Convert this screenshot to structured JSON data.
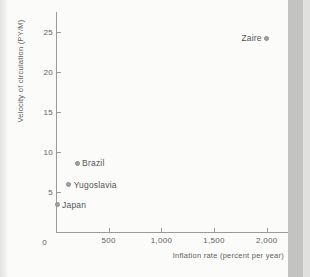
{
  "page": {
    "background": "#fbfbfa",
    "edge_strip_left_color": "#e2e2e1",
    "edge_strip_right_color": "#c3c3c2",
    "edge_strip_right_outer_color": "#e0e0df"
  },
  "chart_data": {
    "type": "scatter",
    "title": "",
    "xlabel": "Inflation rate (percent per year)",
    "ylabel": "Velocity of circulation (PY/M)",
    "xlim": [
      0,
      2200
    ],
    "ylim": [
      0,
      27.5
    ],
    "x_ticks": [
      0,
      500,
      1000,
      1500,
      2000
    ],
    "x_tick_labels": [
      "0",
      "500",
      "1,000",
      "1,500",
      "2,000"
    ],
    "y_ticks": [
      5,
      10,
      15,
      20,
      25
    ],
    "y_tick_labels": [
      "5",
      "10",
      "15",
      "20",
      "25"
    ],
    "grid": false,
    "legend": "none",
    "axis_color": "#9a9a9a",
    "text_color": "#5d5d5d",
    "point_color": "#a0a0a0",
    "point_border_color": "#8e8e8e",
    "points": [
      {
        "label": "Japan",
        "x": 10,
        "y": 3.4,
        "label_side": "right"
      },
      {
        "label": "Yugoslavia",
        "x": 120,
        "y": 5.9,
        "label_side": "right"
      },
      {
        "label": "Brazil",
        "x": 200,
        "y": 8.6,
        "label_side": "right"
      },
      {
        "label": "Zaire",
        "x": 2000,
        "y": 24.2,
        "label_side": "left"
      }
    ]
  }
}
